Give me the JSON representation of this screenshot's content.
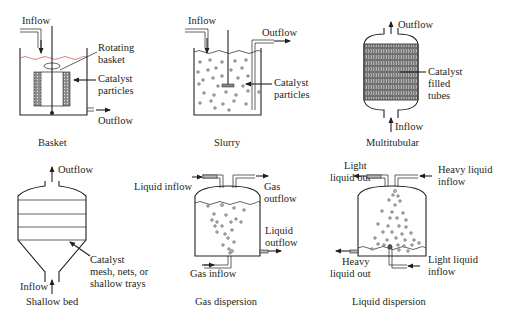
{
  "diagram": {
    "reactors": [
      {
        "id": "basket",
        "caption": "Basket",
        "labels": {
          "inflow": "Inflow",
          "rotating_basket_1": "Rotating",
          "rotating_basket_2": "basket",
          "catalyst_1": "Catalyst",
          "catalyst_2": "particles",
          "outflow": "Outflow"
        }
      },
      {
        "id": "slurry",
        "caption": "Slurry",
        "labels": {
          "inflow": "Inflow",
          "outflow": "Outflow",
          "catalyst_1": "Catalyst",
          "catalyst_2": "particles"
        }
      },
      {
        "id": "multitubular",
        "caption": "Multitubular",
        "labels": {
          "outflow": "Outflow",
          "catalyst_1": "Catalyst",
          "catalyst_2": "filled",
          "catalyst_3": "tubes",
          "inflow": "Inflow"
        }
      },
      {
        "id": "shallow-bed",
        "caption": "Shallow bed",
        "labels": {
          "outflow": "Outflow",
          "inflow": "Inflow",
          "catalyst_1": "Catalyst",
          "catalyst_2": "mesh, nets, or",
          "catalyst_3": "shallow trays"
        }
      },
      {
        "id": "gas-dispersion",
        "caption": "Gas dispersion",
        "labels": {
          "liquid_inflow": "Liquid inflow",
          "gas_outflow_1": "Gas",
          "gas_outflow_2": "outflow",
          "liquid_outflow_1": "Liquid",
          "liquid_outflow_2": "outflow",
          "gas_inflow": "Gas inflow"
        }
      },
      {
        "id": "liquid-dispersion",
        "caption": "Liquid dispersion",
        "labels": {
          "light_out_1": "Light",
          "light_out_2": "liquid out",
          "heavy_in_1": "Heavy liquid",
          "heavy_in_2": "inflow",
          "heavy_out_1": "Heavy",
          "heavy_out_2": "liquid out",
          "light_in_1": "Light liquid",
          "light_in_2": "inflow"
        }
      }
    ]
  }
}
